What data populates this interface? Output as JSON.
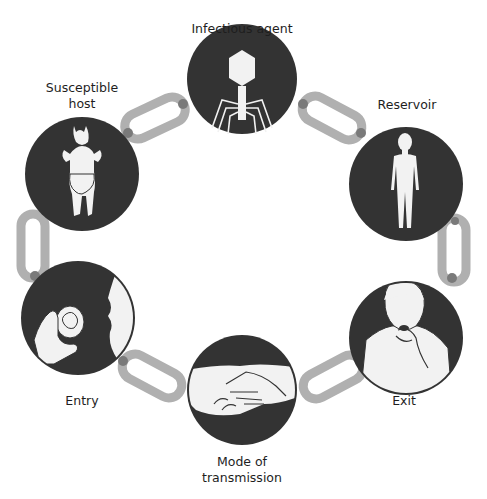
{
  "colors": {
    "circle": "#333333",
    "figure": "#f2f2f2",
    "chain": "#b0b0b0",
    "chain_joint": "#7a7a7a",
    "text": "#1e1e1e"
  },
  "nodes": [
    {
      "id": "infectious-agent",
      "label_lines": [
        "Infectious agent"
      ],
      "icon": "bacteriophage-icon"
    },
    {
      "id": "reservoir",
      "label_lines": [
        "Reservoir"
      ],
      "icon": "human-figure-icon"
    },
    {
      "id": "exit",
      "label_lines": [
        "Exit"
      ],
      "icon": "coughing-person-icon"
    },
    {
      "id": "mode-of-transmission",
      "label_lines": [
        "Mode of",
        "transmission"
      ],
      "icon": "handshake-icon"
    },
    {
      "id": "entry",
      "label_lines": [
        "Entry"
      ],
      "icon": "eating-apple-icon"
    },
    {
      "id": "susceptible-host",
      "label_lines": [
        "Susceptible",
        "host"
      ],
      "icon": "baby-icon"
    }
  ]
}
